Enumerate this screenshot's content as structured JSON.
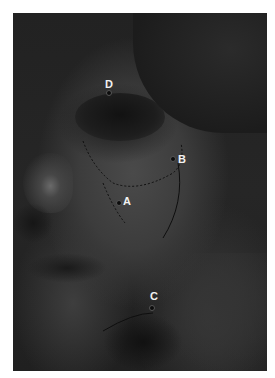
{
  "image": {
    "description": "Grayscale clinical photograph of a face in left profile view with dashed surgical markings and point labels",
    "labels": [
      {
        "id": "D",
        "text": "D",
        "x": 109,
        "y": 85
      },
      {
        "id": "B",
        "text": "B",
        "x": 182,
        "y": 159
      },
      {
        "id": "A",
        "text": "A",
        "x": 126,
        "y": 201
      },
      {
        "id": "C",
        "text": "C",
        "x": 153,
        "y": 296
      }
    ]
  }
}
